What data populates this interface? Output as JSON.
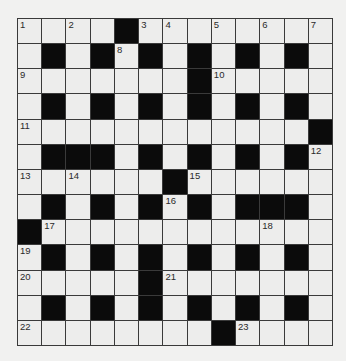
{
  "puzzle": {
    "type": "crossword",
    "rows": 13,
    "cols": 13,
    "colors": {
      "background": "#f1f1f0",
      "cell": "#ededec",
      "block": "#0b0b0b",
      "gridline": "#3a3a3a",
      "number": "#2a2a2a"
    },
    "layout": [
      "....#........",
      ".#.#.#.#.#.#.",
      ".......#.....",
      ".#.#.#.#.#.#.",
      "............#",
      ".###.#.#.#.#.",
      "......#......",
      ".#.#.#.#.###.",
      "#............",
      ".#.#.#.#.#.#.",
      ".....#.......",
      ".#.#.#.#.#.#.",
      "........#...."
    ],
    "numbers": [
      {
        "n": "1",
        "r": 0,
        "c": 0
      },
      {
        "n": "2",
        "r": 0,
        "c": 2
      },
      {
        "n": "3",
        "r": 0,
        "c": 5
      },
      {
        "n": "4",
        "r": 0,
        "c": 6
      },
      {
        "n": "5",
        "r": 0,
        "c": 8
      },
      {
        "n": "6",
        "r": 0,
        "c": 10
      },
      {
        "n": "7",
        "r": 0,
        "c": 12
      },
      {
        "n": "8",
        "r": 1,
        "c": 4
      },
      {
        "n": "9",
        "r": 2,
        "c": 0
      },
      {
        "n": "10",
        "r": 2,
        "c": 8
      },
      {
        "n": "11",
        "r": 4,
        "c": 0
      },
      {
        "n": "12",
        "r": 5,
        "c": 12
      },
      {
        "n": "13",
        "r": 6,
        "c": 0
      },
      {
        "n": "14",
        "r": 6,
        "c": 2
      },
      {
        "n": "15",
        "r": 6,
        "c": 7
      },
      {
        "n": "16",
        "r": 7,
        "c": 6
      },
      {
        "n": "17",
        "r": 8,
        "c": 1
      },
      {
        "n": "18",
        "r": 8,
        "c": 10
      },
      {
        "n": "19",
        "r": 9,
        "c": 0
      },
      {
        "n": "20",
        "r": 10,
        "c": 0
      },
      {
        "n": "21",
        "r": 10,
        "c": 6
      },
      {
        "n": "22",
        "r": 12,
        "c": 0
      },
      {
        "n": "23",
        "r": 12,
        "c": 9
      }
    ]
  }
}
